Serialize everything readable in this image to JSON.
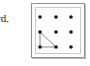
{
  "figure": {
    "caption_fragment": "rd.",
    "panel": {
      "border_color": "#8f8f8f",
      "inner_border_color": "#c9c9c9",
      "shadow_color": "#bdbdbd",
      "background": "#ffffff"
    }
  },
  "chart_data": {
    "type": "scatter",
    "title": "",
    "subtitle": "",
    "xlabel": "",
    "ylabel": "",
    "grid": false,
    "legend": "none",
    "xlim": [
      0,
      2
    ],
    "ylim": [
      0,
      2
    ],
    "x_tick_labels": [],
    "y_tick_labels": [],
    "dot_color": "#161616",
    "dot_radius_px": 1.8,
    "rows": 3,
    "columns": 3,
    "points": [
      {
        "name": "dot-r0-c0",
        "col": 0,
        "row": 0,
        "x": 8,
        "y": 13
      },
      {
        "name": "dot-r0-c1",
        "col": 1,
        "row": 0,
        "x": 24,
        "y": 13
      },
      {
        "name": "dot-r0-c2",
        "col": 2,
        "row": 0,
        "x": 39,
        "y": 13
      },
      {
        "name": "dot-r1-c0",
        "col": 0,
        "row": 1,
        "x": 8,
        "y": 28
      },
      {
        "name": "dot-r1-c1",
        "col": 1,
        "row": 1,
        "x": 24,
        "y": 28
      },
      {
        "name": "dot-r1-c2",
        "col": 2,
        "row": 1,
        "x": 39,
        "y": 28
      },
      {
        "name": "dot-r2-c0",
        "col": 0,
        "row": 2,
        "x": 8,
        "y": 43
      },
      {
        "name": "dot-r2-c1",
        "col": 1,
        "row": 2,
        "x": 24,
        "y": 43
      },
      {
        "name": "dot-r2-c2",
        "col": 2,
        "row": 2,
        "x": 39,
        "y": 43
      }
    ],
    "shapes": [
      {
        "name": "right-triangle",
        "type": "polygon",
        "stroke": "#8a8a8a",
        "stroke_width": 1,
        "fill": "none",
        "vertices": [
          {
            "label": "A",
            "col": 0,
            "row": 1,
            "x": 8,
            "y": 28
          },
          {
            "label": "B",
            "col": 0,
            "row": 2,
            "x": 8,
            "y": 43
          },
          {
            "label": "C",
            "col": 1,
            "row": 2,
            "x": 24,
            "y": 43
          }
        ]
      }
    ]
  }
}
